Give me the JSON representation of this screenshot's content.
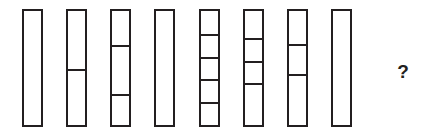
{
  "puzzle": {
    "type": "visual-sequence-matrix",
    "background_color": "#ffffff",
    "stroke_color": "#231f20",
    "canvas": {
      "width": 430,
      "height": 138
    },
    "bar_geometry": {
      "width": 21,
      "height": 118,
      "top": 9,
      "bottom": 127,
      "border_width": 2,
      "left_positions": [
        22,
        66,
        110,
        154,
        199,
        243,
        287,
        331
      ]
    },
    "bars": [
      {
        "index": 1,
        "label": "bar-1",
        "segment_count": 1,
        "divider_count": 0,
        "divider_positions_pct": []
      },
      {
        "index": 2,
        "label": "bar-2",
        "segment_count": 2,
        "divider_count": 1,
        "divider_positions_pct": [
          51
        ]
      },
      {
        "index": 3,
        "label": "bar-3",
        "segment_count": 3,
        "divider_count": 2,
        "divider_positions_pct": [
          30,
          73
        ]
      },
      {
        "index": 4,
        "label": "bar-4",
        "segment_count": 1,
        "divider_count": 0,
        "divider_positions_pct": []
      },
      {
        "index": 5,
        "label": "bar-5",
        "segment_count": 5,
        "divider_count": 4,
        "divider_positions_pct": [
          20,
          40,
          60,
          80
        ]
      },
      {
        "index": 6,
        "label": "bar-6",
        "segment_count": 4,
        "divider_count": 3,
        "divider_positions_pct": [
          24,
          44,
          63
        ]
      },
      {
        "index": 7,
        "label": "bar-7",
        "segment_count": 3,
        "divider_count": 2,
        "divider_positions_pct": [
          29,
          55
        ]
      },
      {
        "index": 8,
        "label": "bar-8",
        "segment_count": 1,
        "divider_count": 0,
        "divider_positions_pct": []
      }
    ],
    "answer_slot": {
      "symbol": "?",
      "x": 394,
      "y": 62,
      "width": 18,
      "height": 22
    }
  }
}
